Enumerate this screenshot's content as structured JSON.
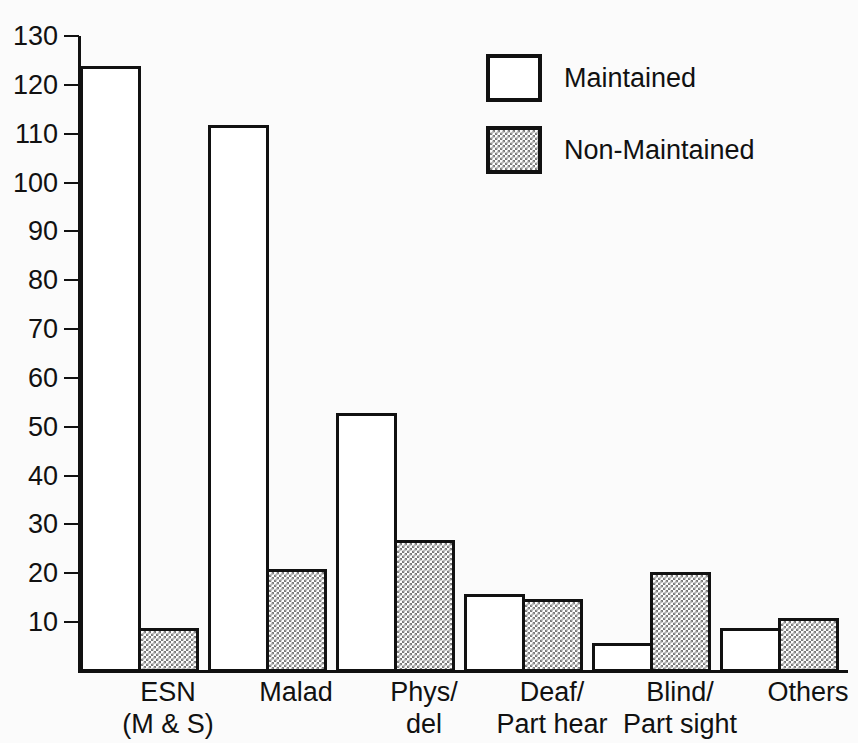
{
  "chart_data": {
    "type": "bar",
    "title": "",
    "subtitle": "",
    "xlabel": "",
    "ylabel": "",
    "ylim": [
      0,
      130
    ],
    "ytick_step": 10,
    "yticks": [
      10,
      20,
      30,
      40,
      50,
      60,
      70,
      80,
      90,
      100,
      110,
      120,
      130
    ],
    "ytick_labels": [
      "10",
      "20",
      "30",
      "40",
      "50",
      "60",
      "70",
      "80",
      "90",
      "100",
      "110",
      "120",
      "130"
    ],
    "grid": false,
    "legend_position": "top-right",
    "categories": [
      "ESN\n(M & S)",
      "Malad",
      "Phys/\ndel",
      "Deaf/\nPart hear",
      "Blind/\nPart sight",
      "Others"
    ],
    "series": [
      {
        "name": "Maintained",
        "fill": "white",
        "values": [
          124,
          112,
          53,
          16,
          6,
          9
        ]
      },
      {
        "name": "Non-Maintained",
        "fill": "stipple",
        "values": [
          9,
          21,
          27,
          15,
          20.5,
          11
        ]
      }
    ]
  },
  "legend": {
    "items": [
      {
        "label": "Maintained",
        "swatch": "white-square-icon"
      },
      {
        "label": "Non-Maintained",
        "swatch": "stipple-square-icon"
      }
    ]
  },
  "colors": {
    "background": "#fbfbfb",
    "ink": "#111111",
    "bar_maintained": "#ffffff",
    "bar_non_maintained_pattern": "#7a7a7a"
  }
}
